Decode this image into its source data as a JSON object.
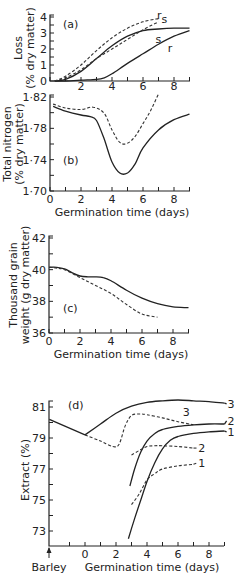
{
  "chart_data": [
    {
      "id": "a",
      "type": "line",
      "panel_label": "(a)",
      "title": "",
      "xlabel": "",
      "ylabel": "Loss\n(% dry matter)",
      "xlim": [
        0,
        9
      ],
      "ylim": [
        0,
        4
      ],
      "xticks": [
        2,
        4,
        6,
        8
      ],
      "yticks": [
        0,
        1,
        2,
        3,
        4
      ],
      "grid": false,
      "series": [
        {
          "name": "s",
          "style": "solid",
          "label_pos": [
            6.8,
            2.6
          ],
          "x": [
            0.3,
            1,
            2,
            3,
            4,
            5,
            6,
            7,
            8,
            9
          ],
          "y": [
            0,
            0.1,
            0.6,
            1.4,
            2.2,
            2.8,
            3.15,
            3.25,
            3.3,
            3.3
          ]
        },
        {
          "name": "r",
          "style": "solid",
          "label_pos": [
            7.6,
            2.05
          ],
          "x": [
            0.3,
            1,
            2,
            3,
            3.5,
            4,
            5,
            6,
            7,
            8,
            9
          ],
          "y": [
            0,
            0,
            0.05,
            0.1,
            0.2,
            0.45,
            1.1,
            1.7,
            2.3,
            2.8,
            3.15
          ]
        },
        {
          "name": "s",
          "style": "dashed",
          "label_pos": [
            7.2,
            3.85
          ],
          "x": [
            0.3,
            1,
            2,
            3,
            4,
            5,
            6,
            7
          ],
          "y": [
            0,
            0.2,
            0.7,
            1.4,
            2.0,
            2.6,
            3.2,
            3.7
          ]
        },
        {
          "name": "r",
          "style": "dashed",
          "label_pos": [
            6.9,
            4.15
          ],
          "x": [
            0.3,
            1,
            2,
            3,
            4,
            5,
            6,
            7
          ],
          "y": [
            0,
            0.3,
            1.0,
            1.9,
            2.7,
            3.3,
            3.7,
            3.9
          ]
        }
      ]
    },
    {
      "id": "b",
      "type": "line",
      "panel_label": "(b)",
      "title": "",
      "xlabel": "Germination time (days)",
      "ylabel": "Total nitrogen\n(% dry matter)",
      "xlim": [
        0,
        9
      ],
      "ylim": [
        1.7,
        1.82
      ],
      "xticks": [
        0,
        2,
        4,
        6,
        8
      ],
      "yticks": [
        1.7,
        1.74,
        1.78,
        1.82
      ],
      "ytick_labels": [
        "1·70",
        "1·74",
        "1·78",
        "1·82"
      ],
      "grid": false,
      "series": [
        {
          "name": "solid",
          "style": "solid",
          "x": [
            0.2,
            1,
            2,
            2.6,
            3,
            3.5,
            4,
            4.5,
            5,
            5.5,
            6,
            7,
            8,
            9
          ],
          "y": [
            1.808,
            1.802,
            1.797,
            1.795,
            1.79,
            1.766,
            1.737,
            1.723,
            1.723,
            1.735,
            1.755,
            1.778,
            1.791,
            1.798
          ]
        },
        {
          "name": "dashed",
          "style": "dashed",
          "x": [
            0.2,
            1,
            2,
            2.8,
            3.5,
            4,
            4.5,
            5,
            5.5,
            6,
            6.5,
            7
          ],
          "y": [
            1.811,
            1.806,
            1.804,
            1.807,
            1.799,
            1.778,
            1.762,
            1.761,
            1.77,
            1.786,
            1.803,
            1.824
          ]
        }
      ]
    },
    {
      "id": "c",
      "type": "line",
      "panel_label": "(c)",
      "title": "",
      "xlabel": "Germination time (days)",
      "ylabel": "Thousand grain\nweight (g dry matter)",
      "xlim": [
        0,
        9
      ],
      "ylim": [
        36,
        42
      ],
      "xticks": [
        0,
        2,
        4,
        6,
        8
      ],
      "yticks": [
        36,
        38,
        40,
        42
      ],
      "grid": false,
      "series": [
        {
          "name": "solid",
          "style": "solid",
          "x": [
            0,
            0.5,
            1,
            1.5,
            2,
            2.5,
            3,
            3.5,
            4,
            5,
            6,
            7,
            8,
            9
          ],
          "y": [
            40.15,
            40.15,
            40.05,
            39.8,
            39.6,
            39.55,
            39.55,
            39.5,
            39.3,
            38.7,
            38.2,
            37.85,
            37.65,
            37.6
          ]
        },
        {
          "name": "dashed",
          "style": "dashed",
          "x": [
            0,
            0.5,
            1,
            2,
            3,
            4,
            5,
            6,
            7
          ],
          "y": [
            40.15,
            40.1,
            40.0,
            39.5,
            39.0,
            38.5,
            37.8,
            37.2,
            37.0
          ]
        }
      ]
    },
    {
      "id": "d",
      "type": "line",
      "panel_label": "(d)",
      "title": "",
      "xlabel": "Germination time (days)",
      "ylabel": "Extract (%)",
      "xlim": [
        -2.3,
        9
      ],
      "ylim": [
        72,
        82
      ],
      "xticks": [
        0,
        2,
        4,
        6,
        8
      ],
      "yticks": [
        73,
        75,
        77,
        79,
        81
      ],
      "x_extra_label": "Barley",
      "grid": false,
      "series": [
        {
          "name": "barley-line",
          "style": "solid",
          "x": [
            -2.3,
            0
          ],
          "y": [
            80.2,
            79.2
          ]
        },
        {
          "name": "3",
          "style": "solid",
          "label_pos": [
            9.2,
            81.2
          ],
          "x": [
            0,
            1,
            2,
            3,
            4,
            5,
            6,
            7,
            8,
            9
          ],
          "y": [
            79.2,
            79.9,
            80.6,
            81.05,
            81.3,
            81.4,
            81.45,
            81.4,
            81.35,
            81.25
          ]
        },
        {
          "name": "3",
          "style": "dashed",
          "label_pos": [
            6.3,
            80.7
          ],
          "x": [
            0,
            1,
            1.8,
            2.2,
            2.6,
            3,
            3.5,
            4,
            5,
            6,
            7
          ],
          "y": [
            79.2,
            78.8,
            78.45,
            78.6,
            79.8,
            80.45,
            80.55,
            80.5,
            80.3,
            80.05,
            79.85
          ]
        },
        {
          "name": "2",
          "style": "solid",
          "label_pos": [
            9.2,
            80.1
          ],
          "x": [
            2.9,
            3.2,
            3.6,
            4,
            4.5,
            5,
            6,
            7,
            8,
            9
          ],
          "y": [
            75.9,
            77.0,
            78.1,
            78.8,
            79.3,
            79.55,
            79.75,
            79.85,
            79.9,
            79.9
          ]
        },
        {
          "name": "1",
          "style": "solid",
          "label_pos": [
            9.2,
            79.4
          ],
          "x": [
            2.8,
            3.2,
            3.6,
            4,
            4.5,
            5,
            5.5,
            6,
            7,
            8,
            9
          ],
          "y": [
            72.5,
            73.8,
            75.0,
            76.2,
            77.4,
            78.3,
            78.85,
            79.1,
            79.3,
            79.4,
            79.45
          ]
        },
        {
          "name": "2",
          "style": "dashed",
          "label_pos": [
            7.3,
            78.35
          ],
          "x": [
            3,
            3.5,
            4,
            4.5,
            5,
            6,
            7
          ],
          "y": [
            77.9,
            78.2,
            78.45,
            78.5,
            78.5,
            78.45,
            78.35
          ]
        },
        {
          "name": "1",
          "style": "dashed",
          "label_pos": [
            7.3,
            77.4
          ],
          "x": [
            3,
            3.5,
            4,
            4.5,
            5,
            6,
            7
          ],
          "y": [
            74.7,
            75.4,
            76.3,
            76.7,
            77.0,
            77.2,
            77.3
          ]
        }
      ]
    }
  ]
}
